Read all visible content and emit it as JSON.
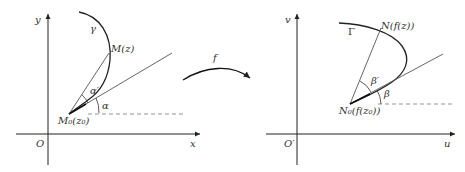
{
  "diagram": {
    "left_panel": {
      "x_axis_label": "x",
      "y_axis_label": "y",
      "origin_label": "O",
      "curve_label": "γ",
      "point_label": "M(z)",
      "base_point_label": "M₀(z₀)",
      "chord_angle_label": "α′",
      "tangent_angle_label": "α"
    },
    "right_panel": {
      "x_axis_label": "u",
      "y_axis_label": "v",
      "origin_label": "O′",
      "curve_label": "Γ",
      "point_label": "N(f(z))",
      "base_point_label": "N₀(f(z₀))",
      "chord_angle_label": "β′",
      "tangent_angle_label": "β"
    },
    "mapping": {
      "label": "f"
    },
    "colors": {
      "ink": "#333333",
      "line": "#555555",
      "dashed": "#777777"
    }
  }
}
